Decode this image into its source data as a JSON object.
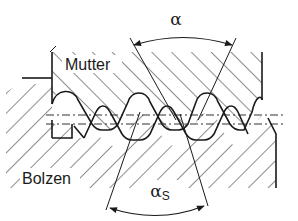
{
  "diagram": {
    "type": "thread-cross-section",
    "labels": {
      "nut": "Mutter",
      "bolt": "Bolzen",
      "flank_angle": "α",
      "flank_angle_sub": "αS",
      "flank_angle_sub_base": "α",
      "flank_angle_sub_index": "S"
    },
    "colors": {
      "line": "#1a1a1a",
      "background": "#ffffff"
    }
  }
}
